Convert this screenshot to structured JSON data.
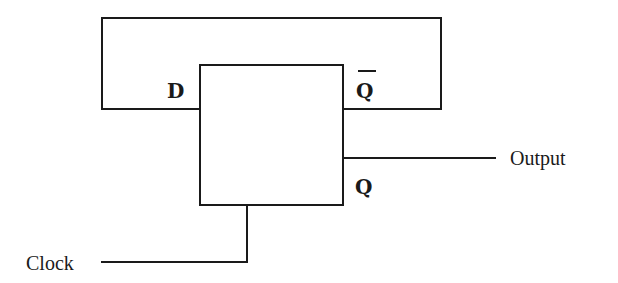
{
  "diagram": {
    "type": "circuit",
    "component": {
      "name": "D flip-flop",
      "pins": {
        "d": "D",
        "q_bar": "Q",
        "q": "Q"
      }
    },
    "labels": {
      "output": "Output",
      "clock": "Clock"
    },
    "connections": [
      {
        "from": "Q̄",
        "to": "D",
        "kind": "feedback"
      },
      {
        "from": "Q",
        "to": "Output"
      },
      {
        "from": "Clock",
        "to": "flip-flop clock input"
      }
    ],
    "colors": {
      "line": "#1a1a1a",
      "background": "#ffffff"
    }
  }
}
